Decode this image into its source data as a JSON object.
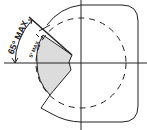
{
  "diagram": {
    "labels": {
      "outer_angle": "65° MAX",
      "inner_angle": "5° MAX"
    },
    "colors": {
      "line": "#222222",
      "shade": "#dcdcdc",
      "background": "#ffffff"
    }
  }
}
